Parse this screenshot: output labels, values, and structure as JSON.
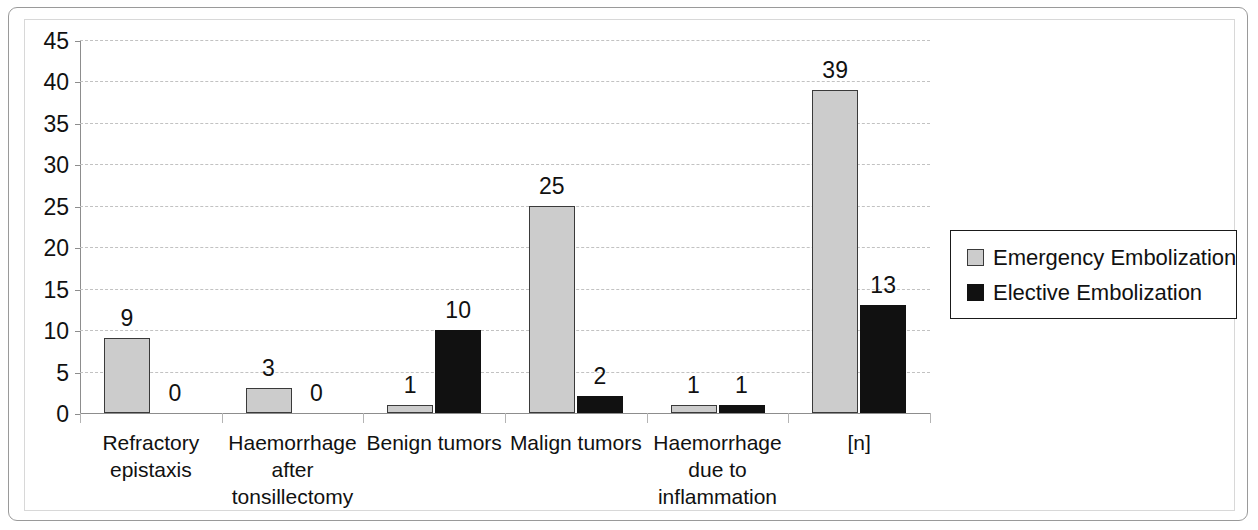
{
  "chart_data": {
    "type": "bar",
    "title": "",
    "xlabel": "",
    "ylabel": "",
    "ylim": [
      0,
      45
    ],
    "ytick_step": 5,
    "yticks": [
      45,
      40,
      35,
      30,
      25,
      20,
      15,
      10,
      5,
      0
    ],
    "grid": true,
    "legend_position": "right",
    "categories": [
      "Refractory epistaxis",
      "Haemorrhage after tonsillectomy",
      "Benign tumors",
      "Malign tumors",
      "Haemorrhage due to inflammation",
      "[n]"
    ],
    "category_lines": [
      [
        "Refractory",
        "epistaxis"
      ],
      [
        "Haemorrhage",
        "after",
        "tonsillectomy"
      ],
      [
        "Benign tumors"
      ],
      [
        "Malign tumors"
      ],
      [
        "Haemorrhage",
        "due to",
        "inflammation"
      ],
      [
        "[n]"
      ]
    ],
    "series": [
      {
        "name": "Emergency Embolization",
        "color": "#cccccc",
        "values": [
          9,
          3,
          1,
          25,
          1,
          39
        ],
        "labels": [
          "9",
          "3",
          "1",
          "25",
          "1",
          "39"
        ]
      },
      {
        "name": "Elective Embolization",
        "color": "#111111",
        "values": [
          0,
          0,
          10,
          2,
          1,
          13
        ],
        "labels": [
          "0",
          "0",
          "10",
          "2",
          "1",
          "13"
        ]
      }
    ]
  },
  "legend": {
    "items": [
      {
        "label": "Emergency Embolization",
        "swatch": "emergency-swatch"
      },
      {
        "label": "Elective Embolization",
        "swatch": "elective-swatch"
      }
    ]
  }
}
